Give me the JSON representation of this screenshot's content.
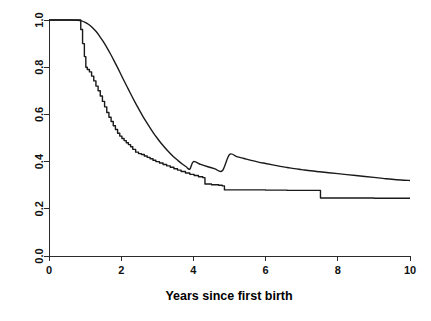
{
  "chart_data": {
    "type": "line",
    "title": "",
    "subtitle": "",
    "xlabel": "Years since first birth",
    "ylabel": "",
    "xlim": [
      0,
      10
    ],
    "ylim": [
      0,
      1
    ],
    "grid": false,
    "legend": "none",
    "xticks": [
      0,
      2,
      4,
      6,
      8,
      10
    ],
    "xticklabels": [
      "0",
      "2",
      "4",
      "6",
      "8",
      "10"
    ],
    "yticks": [
      0.0,
      0.2,
      0.4,
      0.6,
      0.8,
      1.0
    ],
    "yticklabels": [
      "0.0",
      "0.2",
      "0.4",
      "0.6",
      "0.8",
      "1.0"
    ],
    "ytick_label_rotation": -90,
    "series": [
      {
        "name": "smooth-survival-curve",
        "style": "smooth",
        "color": "#1a1a1a",
        "points": [
          [
            0.0,
            1.0
          ],
          [
            0.6,
            1.0
          ],
          [
            0.8,
            0.999
          ],
          [
            0.9,
            0.996
          ],
          [
            1.0,
            0.99
          ],
          [
            1.1,
            0.981
          ],
          [
            1.2,
            0.968
          ],
          [
            1.3,
            0.952
          ],
          [
            1.4,
            0.932
          ],
          [
            1.5,
            0.909
          ],
          [
            1.6,
            0.884
          ],
          [
            1.7,
            0.857
          ],
          [
            1.8,
            0.828
          ],
          [
            1.9,
            0.798
          ],
          [
            2.0,
            0.767
          ],
          [
            2.1,
            0.736
          ],
          [
            2.2,
            0.706
          ],
          [
            2.3,
            0.676
          ],
          [
            2.4,
            0.647
          ],
          [
            2.5,
            0.619
          ],
          [
            2.6,
            0.592
          ],
          [
            2.7,
            0.567
          ],
          [
            2.8,
            0.543
          ],
          [
            2.9,
            0.52
          ],
          [
            3.0,
            0.499
          ],
          [
            3.1,
            0.479
          ],
          [
            3.2,
            0.461
          ],
          [
            3.3,
            0.444
          ],
          [
            3.4,
            0.428
          ],
          [
            3.5,
            0.414
          ],
          [
            3.6,
            0.401
          ],
          [
            3.7,
            0.389
          ],
          [
            3.8,
            0.378
          ],
          [
            3.9,
            0.368
          ],
          [
            4.0,
            0.4
          ],
          [
            4.2,
            0.388
          ],
          [
            4.4,
            0.378
          ],
          [
            4.6,
            0.369
          ],
          [
            4.8,
            0.361
          ],
          [
            5.0,
            0.43
          ],
          [
            5.2,
            0.421
          ],
          [
            5.4,
            0.413
          ],
          [
            5.6,
            0.405
          ],
          [
            5.8,
            0.398
          ],
          [
            6.0,
            0.392
          ],
          [
            6.2,
            0.386
          ],
          [
            6.4,
            0.38
          ],
          [
            6.6,
            0.375
          ],
          [
            6.8,
            0.37
          ],
          [
            7.0,
            0.366
          ],
          [
            7.25,
            0.361
          ],
          [
            7.5,
            0.357
          ],
          [
            7.75,
            0.353
          ],
          [
            8.0,
            0.349
          ],
          [
            8.25,
            0.345
          ],
          [
            8.5,
            0.341
          ],
          [
            8.75,
            0.337
          ],
          [
            9.0,
            0.333
          ],
          [
            9.25,
            0.329
          ],
          [
            9.5,
            0.325
          ],
          [
            9.75,
            0.322
          ],
          [
            10.0,
            0.32
          ]
        ]
      },
      {
        "name": "stepped-kaplan-meier-curve",
        "style": "step",
        "color": "#1a1a1a",
        "points": [
          [
            0.0,
            1.0
          ],
          [
            0.82,
            1.0
          ],
          [
            0.88,
            0.96
          ],
          [
            0.93,
            0.9
          ],
          [
            0.98,
            0.845
          ],
          [
            1.02,
            0.8
          ],
          [
            1.06,
            0.79
          ],
          [
            1.12,
            0.78
          ],
          [
            1.18,
            0.762
          ],
          [
            1.24,
            0.742
          ],
          [
            1.3,
            0.72
          ],
          [
            1.36,
            0.7
          ],
          [
            1.42,
            0.678
          ],
          [
            1.48,
            0.655
          ],
          [
            1.54,
            0.632
          ],
          [
            1.6,
            0.608
          ],
          [
            1.66,
            0.588
          ],
          [
            1.72,
            0.57
          ],
          [
            1.78,
            0.552
          ],
          [
            1.84,
            0.536
          ],
          [
            1.9,
            0.52
          ],
          [
            1.96,
            0.508
          ],
          [
            2.02,
            0.498
          ],
          [
            2.08,
            0.489
          ],
          [
            2.14,
            0.48
          ],
          [
            2.2,
            0.472
          ],
          [
            2.26,
            0.463
          ],
          [
            2.32,
            0.452
          ],
          [
            2.4,
            0.44
          ],
          [
            2.48,
            0.434
          ],
          [
            2.56,
            0.43
          ],
          [
            2.64,
            0.424
          ],
          [
            2.72,
            0.418
          ],
          [
            2.8,
            0.412
          ],
          [
            2.88,
            0.406
          ],
          [
            2.96,
            0.4
          ],
          [
            3.06,
            0.394
          ],
          [
            3.16,
            0.388
          ],
          [
            3.26,
            0.382
          ],
          [
            3.36,
            0.376
          ],
          [
            3.46,
            0.37
          ],
          [
            3.56,
            0.364
          ],
          [
            3.66,
            0.358
          ],
          [
            3.78,
            0.352
          ],
          [
            3.9,
            0.346
          ],
          [
            4.02,
            0.341
          ],
          [
            4.14,
            0.336
          ],
          [
            4.26,
            0.332
          ],
          [
            4.32,
            0.305
          ],
          [
            4.5,
            0.302
          ],
          [
            4.7,
            0.3
          ],
          [
            4.8,
            0.297
          ],
          [
            4.86,
            0.28
          ],
          [
            5.4,
            0.28
          ],
          [
            6.0,
            0.279
          ],
          [
            6.6,
            0.278
          ],
          [
            7.2,
            0.278
          ],
          [
            7.46,
            0.278
          ],
          [
            7.52,
            0.246
          ],
          [
            8.2,
            0.246
          ],
          [
            9.0,
            0.245
          ],
          [
            9.6,
            0.245
          ],
          [
            10.0,
            0.245
          ]
        ]
      }
    ],
    "annotations": []
  },
  "geometry": {
    "plot_left_px": 49,
    "plot_right_px": 410,
    "plot_top_px": 20,
    "plot_bottom_px": 256,
    "xaxis_line_y_px": 256,
    "yaxis_line_x_px": 49,
    "tick_length_px": 5
  },
  "style": {
    "background": "#ffffff",
    "axis_color": "#2b2b2b",
    "curve_color": "#1a1a1a",
    "text_color": "#111111"
  }
}
